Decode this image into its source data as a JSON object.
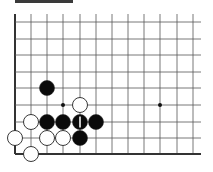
{
  "diagram": {
    "type": "go-board-fragment",
    "header_bar": true,
    "grid": {
      "x_lines": [
        15,
        31,
        47,
        63,
        80,
        96,
        112,
        128,
        144,
        160,
        177,
        193
      ],
      "y_lines": [
        22,
        39,
        55,
        72,
        88,
        105,
        122,
        138,
        154
      ],
      "top_extent": 14,
      "right_extent": 201,
      "edges": [
        "left",
        "bottom"
      ],
      "line_color": "#555555",
      "edge_color": "#333333"
    },
    "star_points": [
      {
        "x": 63,
        "y": 105
      },
      {
        "x": 160,
        "y": 105
      }
    ],
    "stones": [
      {
        "color": "black",
        "x": 47,
        "y": 88
      },
      {
        "color": "white",
        "x": 80,
        "y": 105
      },
      {
        "color": "white",
        "x": 31,
        "y": 122
      },
      {
        "color": "black",
        "x": 47,
        "y": 122
      },
      {
        "color": "black",
        "x": 63,
        "y": 122
      },
      {
        "color": "black",
        "x": 80,
        "y": 122,
        "label": "1"
      },
      {
        "color": "black",
        "x": 96,
        "y": 122
      },
      {
        "color": "white",
        "x": 15,
        "y": 138
      },
      {
        "color": "white",
        "x": 47,
        "y": 138
      },
      {
        "color": "white",
        "x": 63,
        "y": 138
      },
      {
        "color": "black",
        "x": 80,
        "y": 138
      },
      {
        "color": "white",
        "x": 31,
        "y": 154
      }
    ],
    "stone_radius": 7.5
  }
}
